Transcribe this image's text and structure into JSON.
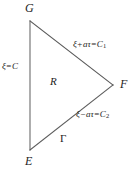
{
  "figure": {
    "name": "characteristic-triangle",
    "background_color": "#ffffff",
    "line_color": "#555555",
    "text_color": "#1d1d1d",
    "width": 137,
    "height": 173
  },
  "vertices": {
    "top_left": "G",
    "bottom_left": "E",
    "right": "F"
  },
  "region": {
    "interior_label": "R",
    "boundary_label": "Γ"
  },
  "edges": {
    "left": {
      "symbol": "ξ",
      "operator": "=",
      "value": "C",
      "subscript": ""
    },
    "upper": {
      "symbol": "ξ",
      "operator": "+",
      "term": "aτ",
      "equals": "=",
      "value": "C",
      "subscript": "1"
    },
    "lower": {
      "symbol": "ξ",
      "operator": "−",
      "term": "aτ",
      "equals": "=",
      "value": "C",
      "subscript": "2"
    }
  },
  "geometry": {
    "point_g": [
      30,
      21
    ],
    "point_e": [
      30,
      150
    ],
    "point_f": [
      113,
      85
    ]
  }
}
